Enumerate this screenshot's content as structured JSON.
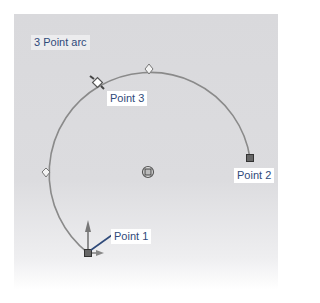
{
  "title": "3 Point arc",
  "points": [
    {
      "label": "Point 1",
      "x": 88,
      "y": 253
    },
    {
      "label": "Point 2",
      "x": 250,
      "y": 158
    },
    {
      "label": "Point 3",
      "x": 97,
      "y": 82
    }
  ],
  "center": {
    "x": 148,
    "y": 172
  },
  "colors": {
    "arc": "#8a8a8a",
    "label_text": "#2f4a7a",
    "leader": "#2f4a7a",
    "panel": "#d9d9dc"
  }
}
